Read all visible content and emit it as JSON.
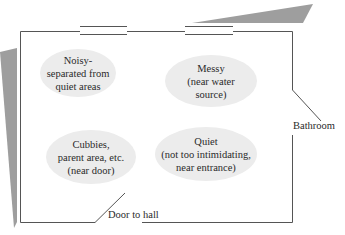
{
  "diagram": {
    "type": "classroom-floor-plan",
    "colors": {
      "wall": "#555555",
      "shadow": "#9a9a9a",
      "zone_fill": "#ececec",
      "text": "#2a2a2a"
    },
    "zones": [
      {
        "id": "noisy",
        "text": "Noisy-\nseparated from\nquiet areas"
      },
      {
        "id": "messy",
        "text": "Messy\n(near water\nsource)"
      },
      {
        "id": "cubbies",
        "text": "Cubbies,\nparent area, etc.\n(near door)"
      },
      {
        "id": "quiet",
        "text": "Quiet\n(not too intimidating,\nnear entrance)"
      }
    ],
    "labels": {
      "bathroom": "Bathroom",
      "door_to_hall": "Door to hall"
    },
    "windows": 2
  }
}
